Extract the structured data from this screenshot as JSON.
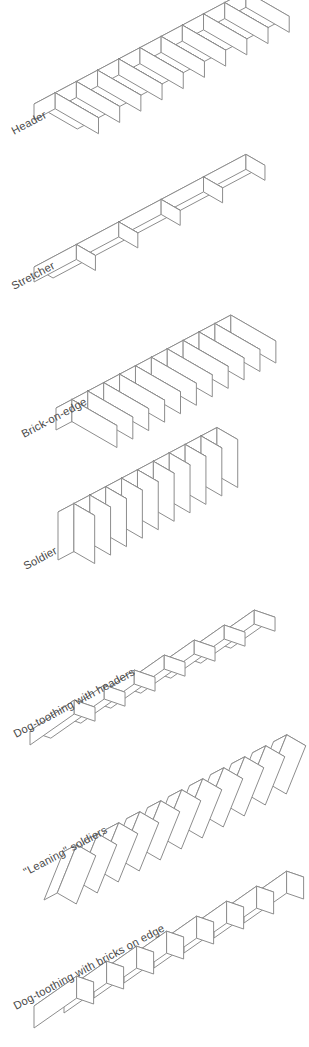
{
  "page": {
    "background": "#ffffff",
    "outline_color": "#8d8d8d",
    "joint_color": "#3b3b3b",
    "label_color": "#4a4a4a",
    "face_fill": "#ffffff",
    "projection": "isometric",
    "label_angle_deg": -28
  },
  "figures": [
    {
      "id": "header",
      "label": "Header",
      "brick_count": 10,
      "orientation": "bricks laid flat, short face outward (header course)",
      "label_x": 14,
      "label_y": 135,
      "origin_x": 34,
      "origin_y": 120,
      "brick_len": 24,
      "brick_wid": 50,
      "brick_hgt": 16,
      "step_axis": "right-up"
    },
    {
      "id": "stretcher",
      "label": "Stretcher",
      "brick_count": 5,
      "orientation": "bricks laid flat, long face outward (stretcher course)",
      "label_x": 14,
      "label_y": 290,
      "origin_x": 34,
      "origin_y": 282,
      "brick_len": 48,
      "brick_wid": 22,
      "brick_hgt": 15,
      "step_axis": "right-up"
    },
    {
      "id": "brick-on-edge",
      "label": "Brick-on-edge",
      "brick_count": 11,
      "orientation": "bricks on their narrow edge, long face up",
      "label_x": 24,
      "label_y": 438,
      "origin_x": 56,
      "origin_y": 430,
      "brick_len": 18,
      "brick_wid": 52,
      "brick_hgt": 22,
      "step_axis": "right-up"
    },
    {
      "id": "soldier",
      "label": "Soldier",
      "brick_count": 10,
      "orientation": "bricks standing upright on end (soldier course)",
      "label_x": 26,
      "label_y": 570,
      "origin_x": 58,
      "origin_y": 560,
      "brick_len": 18,
      "brick_wid": 24,
      "brick_hgt": 48,
      "step_axis": "right-up"
    },
    {
      "id": "dog-toothing-headers",
      "label": "Dog-toothing with headers",
      "brick_count": 7,
      "orientation": "headers rotated in plan, staggered saw-tooth",
      "label_x": 16,
      "label_y": 738,
      "origin_x": 30,
      "origin_y": 745,
      "brick_len": 54,
      "brick_wid": 22,
      "brick_hgt": 14,
      "rotation_deg": 20,
      "step_axis": "right-up"
    },
    {
      "id": "leaning-soldiers",
      "label": "\"Leaning\" soldiers",
      "brick_count": 11,
      "orientation": "upright bricks tilted like falling dominoes",
      "label_x": 26,
      "label_y": 876,
      "origin_x": 44,
      "origin_y": 900,
      "brick_len": 15,
      "brick_wid": 22,
      "brick_hgt": 52,
      "lean_deg": 22,
      "step_axis": "right-up"
    },
    {
      "id": "dog-toothing-bricks-on-edge",
      "label": "Dog-toothing with bricks on edge",
      "brick_count": 8,
      "orientation": "bricks on edge rotated in plan, saw-tooth",
      "label_x": 16,
      "label_y": 1010,
      "origin_x": 34,
      "origin_y": 1028,
      "brick_len": 52,
      "brick_wid": 18,
      "brick_hgt": 22,
      "rotation_deg": 20,
      "step_axis": "right-up"
    }
  ]
}
